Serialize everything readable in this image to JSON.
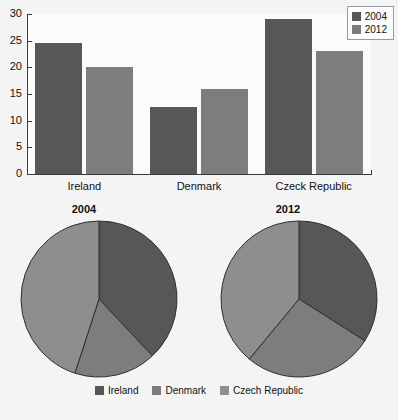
{
  "chart_data": [
    {
      "type": "bar",
      "title": "",
      "xlabel": "",
      "ylabel": "",
      "categories": [
        "Ireland",
        "Denmark",
        "Czeck Republic"
      ],
      "series": [
        {
          "name": "2004",
          "values": [
            24.5,
            12.5,
            29
          ],
          "color": "#575757"
        },
        {
          "name": "2012",
          "values": [
            20,
            16,
            23
          ],
          "color": "#7d7d7d"
        }
      ],
      "ylim": [
        0,
        30
      ],
      "yticks": [
        0,
        5,
        10,
        15,
        20,
        25,
        30
      ],
      "ytick_labels": [
        "0",
        "5",
        "10",
        "15",
        "20",
        "25",
        "30"
      ],
      "grid": false,
      "legend_position": "top-right",
      "legend_entries": [
        "2004",
        "2012"
      ]
    },
    {
      "type": "pie",
      "title": "2004",
      "labels": [
        "Ireland",
        "Denmark",
        "Czech Republic"
      ],
      "values": [
        38,
        17,
        45
      ],
      "colors": [
        "#575757",
        "#7d7d7d",
        "#8e8e8e"
      ],
      "start_angle_deg": 0,
      "legend_position": "bottom"
    },
    {
      "type": "pie",
      "title": "2012",
      "labels": [
        "Ireland",
        "Denmark",
        "Czech Republic"
      ],
      "values": [
        34,
        27,
        39
      ],
      "colors": [
        "#575757",
        "#7d7d7d",
        "#8e8e8e"
      ],
      "start_angle_deg": 0,
      "legend_position": "bottom"
    }
  ],
  "bar_chart": {
    "legend": {
      "items": [
        {
          "label": "2004",
          "color": "#575757"
        },
        {
          "label": "2012",
          "color": "#7d7d7d"
        }
      ]
    },
    "y_axis": {
      "ticks": [
        "30",
        "25",
        "20",
        "15",
        "10",
        "5",
        "0"
      ]
    },
    "categories": [
      {
        "label": "Ireland"
      },
      {
        "label": "Denmark"
      },
      {
        "label": "Czeck Republic"
      }
    ]
  },
  "pies": {
    "left": {
      "title": "2004"
    },
    "right": {
      "title": "2012"
    },
    "legend": {
      "items": [
        {
          "label": "Ireland",
          "color": "#575757"
        },
        {
          "label": "Denmark",
          "color": "#7d7d7d"
        },
        {
          "label": "Czech Republic",
          "color": "#8e8e8e"
        }
      ]
    }
  },
  "colors": {
    "background": "#f4f4f4",
    "plot_background": "#fbfbfb",
    "series_2004": "#575757",
    "series_2012": "#7d7d7d",
    "pie_third": "#8e8e8e",
    "axis": "#3a3a3a",
    "text": "#111111"
  }
}
